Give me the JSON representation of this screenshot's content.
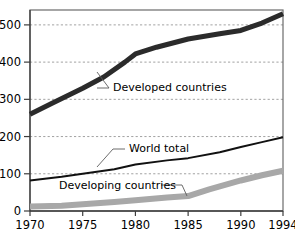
{
  "chart_data": {
    "type": "line",
    "title": "",
    "subtitle": "",
    "xlabel": "",
    "ylabel": "",
    "x": [
      1970,
      1975,
      1980,
      1985,
      1990,
      1994
    ],
    "xlim": [
      1970,
      1994
    ],
    "ylim": [
      0,
      540
    ],
    "yticks": [
      0,
      100,
      200,
      300,
      400,
      500
    ],
    "xticks": [
      1970,
      1975,
      1980,
      1985,
      1990,
      1994
    ],
    "grid": "horizontal-dashed",
    "legend": "inline-annotations",
    "series": [
      {
        "name": "Developed countries",
        "color": "#2b2b2b",
        "width": 5,
        "x": [
          1970,
          1972,
          1975,
          1977,
          1979,
          1980,
          1982,
          1985,
          1988,
          1990,
          1992,
          1994
        ],
        "values": [
          260,
          288,
          330,
          360,
          400,
          422,
          440,
          462,
          476,
          485,
          505,
          530
        ]
      },
      {
        "name": "World total",
        "color": "#111111",
        "width": 2,
        "x": [
          1970,
          1973,
          1975,
          1978,
          1980,
          1983,
          1985,
          1988,
          1990,
          1992,
          1994
        ],
        "values": [
          82,
          92,
          100,
          112,
          125,
          136,
          142,
          158,
          172,
          185,
          198
        ]
      },
      {
        "name": "Developing countries",
        "color": "#a8a8a8",
        "width": 6,
        "x": [
          1970,
          1973,
          1975,
          1978,
          1980,
          1983,
          1985,
          1987,
          1990,
          1992,
          1994
        ],
        "values": [
          12,
          14,
          18,
          24,
          29,
          36,
          40,
          58,
          82,
          96,
          108
        ]
      }
    ],
    "annotations": [
      {
        "text": "Developed countries",
        "text_x": 113,
        "text_y": 91,
        "anchor": "start",
        "leader": "M 97,88 L 109,88 L 97,72"
      },
      {
        "text": "World total",
        "text_x": 129,
        "text_y": 152,
        "anchor": "start",
        "leader": "M 125,149 L 113,149 L 97,167"
      },
      {
        "text": "Developing countries",
        "text_x": 59,
        "text_y": 189,
        "anchor": "start",
        "leader": "M 161,185 L 182,185 L 187,196"
      }
    ],
    "ytick_labels": [
      "0",
      "100",
      "200",
      "300",
      "400",
      "500"
    ],
    "xtick_labels": [
      "1970",
      "1975",
      "1980",
      "1985",
      "1990",
      "1994"
    ]
  },
  "colors": {
    "background": "#ffffff",
    "frame": "#6b6b6b",
    "grid": "#8a8a8a",
    "axis": "#3d3d3d",
    "developed": "#2b2b2b",
    "world_total": "#111111",
    "developing": "#a8a8a8"
  }
}
